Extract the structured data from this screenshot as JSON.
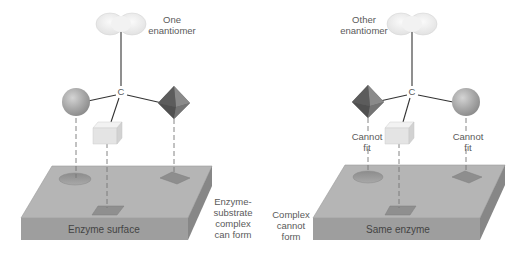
{
  "figure": {
    "panels": [
      {
        "id": "left",
        "enantiomer_label_line1": "One",
        "enantiomer_label_line2": "enantiomer",
        "center_atom": "C",
        "surface_label": "Enzyme surface",
        "outcome_lines": [
          "Enzyme-",
          "substrate",
          "complex",
          "can form"
        ]
      },
      {
        "id": "right",
        "enantiomer_label_line1": "Other",
        "enantiomer_label_line2": "enantiomer",
        "center_atom": "C",
        "surface_label": "Same enzyme",
        "cannot_fit_left": [
          "Cannot",
          "fit"
        ],
        "cannot_fit_right": [
          "Cannot",
          "fit"
        ],
        "outcome_lines": [
          "Complex",
          "cannot",
          "form"
        ]
      }
    ],
    "colors": {
      "slab_top": "#b4b4b4",
      "slab_front": "#9c9c9c",
      "slab_side": "#8a8a8a",
      "sphere": "#a9a9a9",
      "octahedron": "#6e6e6e",
      "cube": "#e6e6e6",
      "cloud": "#f0f0f0"
    }
  }
}
